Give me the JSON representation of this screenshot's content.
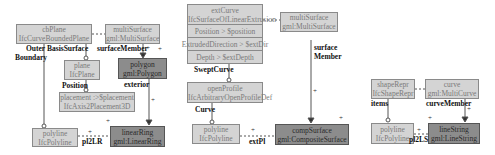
{
  "diagrams": [
    {
      "boxes": {
        "cbPlane": {
          "name": "cbPlane",
          "type": "IfcCurveBoundedPlane"
        },
        "multiSurface": {
          "name": "multiSurface",
          "type": "gml:MultiSurface"
        },
        "plane": {
          "name": "plane",
          "type": "IfcPlane"
        },
        "polygon": {
          "name": "polygon",
          "type": "gml:Polygon"
        },
        "placement": {
          "name": "placement :>$placement",
          "type": "IfcAxis2Placement3D"
        },
        "polyline": {
          "name": "polyline",
          "type": "IfcPolyline"
        },
        "linearRing": {
          "name": "linearRing",
          "type": "gml:LinearRing"
        }
      },
      "labels": {
        "outer": "Outer",
        "boundary": "Boundary",
        "basis_surface": "BasisSurface",
        "surface_member": "surfaceMember",
        "position": "Position",
        "exterior": "exterior",
        "pl2lr": "pl2LR"
      }
    },
    {
      "boxes": {
        "extCurve": {
          "name": "extCurve",
          "type": "IfcSurfaceOfLinearExtrusion",
          "rows": [
            "Position > $position",
            "ExtrudedDirection > $extDir",
            "Depth > $extDepth"
          ]
        },
        "multiSurface": {
          "name": "multiSurface",
          "type": "gml:MultiSurface"
        },
        "openProfile": {
          "name": "openProfile",
          "type": "IfcArbitraryOpenProfileDef"
        },
        "polyline": {
          "name": "polyline",
          "type": "IfcPolyline"
        },
        "compSurface": {
          "name": "compSurface",
          "type": "gml:CompositeSurface"
        }
      },
      "labels": {
        "swept_curve": "SweptCurve",
        "curve": "Curve",
        "surface": "surface",
        "member": "Member",
        "extPl": "extPl"
      }
    },
    {
      "boxes": {
        "shapeRepr": {
          "name": "shapeRepr",
          "type": "IfcShapeRepr"
        },
        "curve": {
          "name": "curve",
          "type": "gml:MultiCurve"
        },
        "polyline": {
          "name": "polyline",
          "type": "IfcPolyline"
        },
        "lineString": {
          "name": "lineString",
          "type": "gml:LineString"
        }
      },
      "labels": {
        "items": "items",
        "curve_member": "curveMember",
        "pl2LS": "pl2LS"
      }
    }
  ],
  "multiplicity": "+"
}
